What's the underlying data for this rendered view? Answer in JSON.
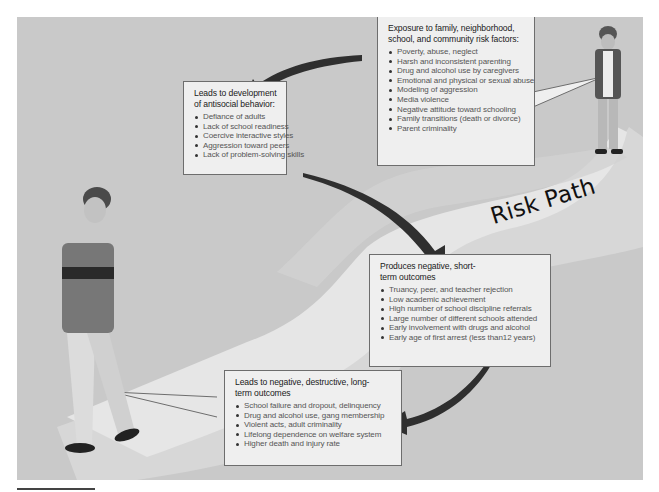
{
  "diagram": {
    "label": "Risk Path",
    "colors": {
      "panel_bg": "#c9c9c9",
      "path_light": "#e4e4e4",
      "path_mid": "#d6d6d6",
      "box_bg": "#efefef",
      "box_border": "#6d6d6d",
      "arrow": "#2f2f2f"
    },
    "boxes": [
      {
        "id": "exposure",
        "title": "Exposure to family, neighborhood, school, and community risk factors:",
        "items": [
          "Poverty, abuse, neglect",
          "Harsh and inconsistent parenting",
          "Drug and alcohol use by caregivers",
          "Emotional and physical or sexual abuse",
          "Modeling of aggression",
          "Media violence",
          "Negative attitude toward schooling",
          "Family transitions (death or divorce)",
          "Parent criminality"
        ]
      },
      {
        "id": "antisocial",
        "title": "Leads to development of antisocial behavior:",
        "items": [
          "Defiance of adults",
          "Lack of school readiness",
          "Coercive interactive styles",
          "Aggression toward peers",
          "Lack of problem-solving skills"
        ]
      },
      {
        "id": "short-term",
        "title": "Produces negative, short-term outcomes",
        "items": [
          "Truancy, peer, and teacher rejection",
          "Low academic achievement",
          "High number of school discipline referrals",
          "Large number of different schools attended",
          "Early involvement with drugs and alcohol",
          "Early age of first arrest (less than12 years)"
        ]
      },
      {
        "id": "long-term",
        "title": "Leads to negative, destructive, long-term outcomes",
        "items": [
          "School failure and dropout, delinquency",
          "Drug and alcohol use, gang membership",
          "Violent acts, adult criminality",
          "Lifelong dependence on welfare system",
          "Higher death and injury rate"
        ]
      }
    ],
    "figures": [
      {
        "id": "young-child",
        "description": "young boy standing at start of path"
      },
      {
        "id": "adolescent",
        "description": "adolescent boy walking at end of path"
      }
    ],
    "flow": [
      "exposure",
      "antisocial",
      "short-term",
      "long-term"
    ]
  }
}
